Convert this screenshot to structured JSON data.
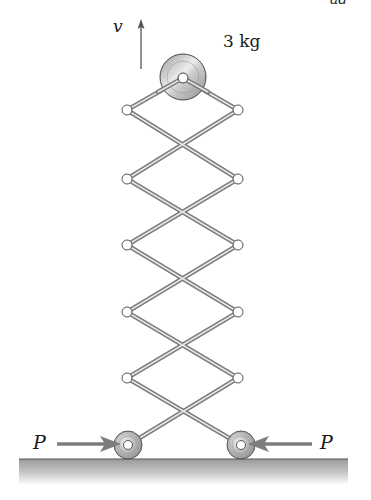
{
  "figure": {
    "corner_mark": "ad",
    "velocity_label": "v",
    "mass_label": "3 kg",
    "force_left_label": "P",
    "force_right_label": "P"
  },
  "geometry": {
    "left_joint_x": 127,
    "right_joint_x": 238,
    "joint_rows_y": [
      110,
      179,
      245,
      312,
      378
    ],
    "top_pivot": [
      183,
      78
    ],
    "wheel_centers": [
      [
        128,
        445
      ],
      [
        241,
        445
      ]
    ],
    "ground_y": 459
  },
  "colors": {
    "link": "#8a8a8a",
    "link_highlight": "#e0e0e0",
    "arrow": "#7d7d7d",
    "ground": "#b5b5b5",
    "disk": "#bdbdbd"
  }
}
